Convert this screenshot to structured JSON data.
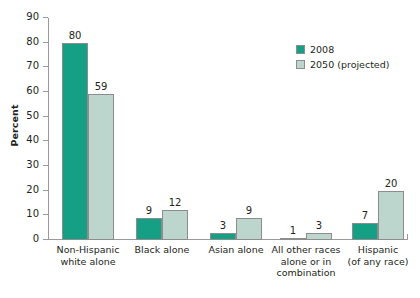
{
  "chart_data": {
    "type": "bar",
    "title": "",
    "xlabel": "",
    "ylabel": "Percent",
    "ylim": [
      0,
      90
    ],
    "ytick_step": 10,
    "yticks": [
      90,
      80,
      70,
      60,
      50,
      40,
      30,
      20,
      10,
      0
    ],
    "grid": false,
    "legend_position": "top-right",
    "categories": [
      "Non-Hispanic\nwhite alone",
      "Black alone",
      "Asian alone",
      "All other races\nalone or in\ncombination",
      "Hispanic\n(of any race)"
    ],
    "category_lines": [
      [
        "Non-Hispanic",
        "white alone"
      ],
      [
        "Black alone"
      ],
      [
        "Asian alone"
      ],
      [
        "All other races",
        "alone or in",
        "combination"
      ],
      [
        "Hispanic",
        "(of any race)"
      ]
    ],
    "series": [
      {
        "name": "2008",
        "color": "#15a085",
        "values": [
          80,
          9,
          3,
          1,
          7
        ]
      },
      {
        "name": "2050 (projected)",
        "color": "#bcd6ce",
        "values": [
          59,
          12,
          9,
          3,
          20
        ]
      }
    ]
  },
  "legend": {
    "items": [
      {
        "label": "2008",
        "color": "#15a085"
      },
      {
        "label": "2050 (projected)",
        "color": "#bcd6ce"
      }
    ]
  },
  "axis": {
    "y_title": "Percent"
  },
  "footer": {
    "note": ""
  }
}
